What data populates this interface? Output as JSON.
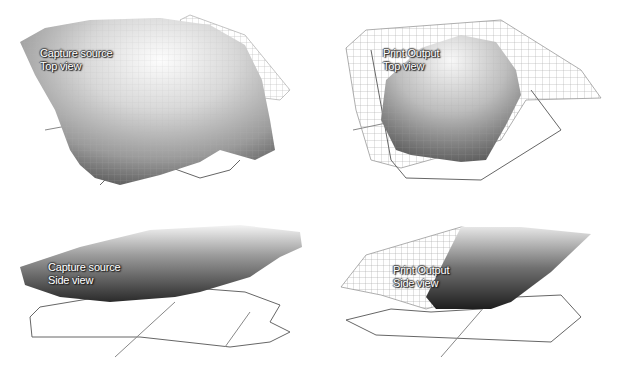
{
  "panels": [
    {
      "id": "capture-top",
      "line1": "Capture source",
      "line2": "Top view"
    },
    {
      "id": "print-top",
      "line1": "Print Output",
      "line2": "Top view"
    },
    {
      "id": "capture-side",
      "line1": "Capture source",
      "line2": "Side view"
    },
    {
      "id": "print-side",
      "line1": "Print Output",
      "line2": "Side view"
    }
  ],
  "colors": {
    "background": "#ffffff",
    "wireframe": "#9a9a9a",
    "outline": "#555555",
    "label_text": "#ffffff"
  }
}
